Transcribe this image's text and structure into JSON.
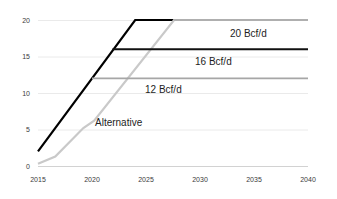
{
  "chart_data": {
    "type": "line",
    "title": "",
    "subtitle": "",
    "xlabel": "",
    "ylabel": "",
    "xlim": [
      2015,
      2040
    ],
    "ylim": [
      0,
      20
    ],
    "grid": true,
    "grid_axis": "y",
    "legend": "inline-annotations",
    "legend_position": "on-plot",
    "x_ticks": [
      "2015",
      "2020",
      "2025",
      "2030",
      "2035",
      "2040"
    ],
    "y_ticks": [
      "0",
      "5",
      "10",
      "15",
      "20"
    ],
    "units": "Bcf/d",
    "series": [
      {
        "name": "Base ramp to 20 Bcf/d",
        "color": "#000000",
        "width": 2.2,
        "points": [
          {
            "x": 2015,
            "y": 2.0
          },
          {
            "x": 2024,
            "y": 20.0
          },
          {
            "x": 2027.6,
            "y": 20.0
          }
        ]
      },
      {
        "name": "Alternative",
        "color": "#c9c9c9",
        "width": 2.2,
        "points": [
          {
            "x": 2015,
            "y": 0.3
          },
          {
            "x": 2016.6,
            "y": 1.3
          },
          {
            "x": 2019.2,
            "y": 5.2
          },
          {
            "x": 2020.2,
            "y": 6.2
          },
          {
            "x": 2027.6,
            "y": 20.0
          },
          {
            "x": 2040,
            "y": 20.0
          }
        ]
      },
      {
        "name": "20 Bcf/d",
        "color": "#a6a6a6",
        "width": 1.4,
        "points": [
          {
            "x": 2027.6,
            "y": 20.0
          },
          {
            "x": 2040,
            "y": 20.0
          }
        ]
      },
      {
        "name": "16 Bcf/d",
        "color": "#111111",
        "width": 2.0,
        "points": [
          {
            "x": 2021.9,
            "y": 16.0
          },
          {
            "x": 2040,
            "y": 16.0
          }
        ]
      },
      {
        "name": "12 Bcf/d",
        "color": "#a6a6a6",
        "width": 1.6,
        "points": [
          {
            "x": 2020.0,
            "y": 12.0
          },
          {
            "x": 2040,
            "y": 12.0
          }
        ]
      }
    ],
    "annotations": [
      {
        "label": "20 Bcf/d",
        "x": 2030.0,
        "y": 18.0
      },
      {
        "label": "16 Bcf/d",
        "x": 2027.0,
        "y": 14.1
      },
      {
        "label": "12 Bcf/d",
        "x": 2024.0,
        "y": 10.3
      },
      {
        "label": "Alternative",
        "x": 2020.3,
        "y": 5.6
      }
    ]
  },
  "axes": {
    "y_ticks": [
      {
        "label": "20",
        "value": 20
      },
      {
        "label": "15",
        "value": 15
      },
      {
        "label": "10",
        "value": 10
      },
      {
        "label": "5",
        "value": 5
      },
      {
        "label": "0",
        "value": 0
      }
    ],
    "x_ticks": [
      {
        "label": "2015",
        "value": 2015
      },
      {
        "label": "2020",
        "value": 2020
      },
      {
        "label": "2025",
        "value": 2025
      },
      {
        "label": "2030",
        "value": 2030
      },
      {
        "label": "2035",
        "value": 2035
      },
      {
        "label": "2040",
        "value": 2040
      }
    ]
  },
  "colors": {
    "background": "#ffffff",
    "gridline": "#eaeaea",
    "axis_line": "#d2d2d2",
    "tick_text": "#3b3b3b",
    "annotation_text": "#1d1d1d",
    "series_black": "#000000",
    "series_gray_light": "#c9c9c9",
    "series_gray_mid": "#a6a6a6"
  }
}
